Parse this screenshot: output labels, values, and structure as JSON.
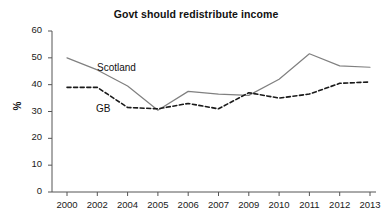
{
  "chart_data": {
    "type": "line",
    "title": "Govt should redistribute income",
    "xlabel": "",
    "ylabel": "%",
    "categories": [
      "2000",
      "2002",
      "2004",
      "2005",
      "2006",
      "2007",
      "2009",
      "2010",
      "2011",
      "2012",
      "2013"
    ],
    "ylim": [
      0,
      60
    ],
    "yticks": [
      0,
      10,
      20,
      30,
      40,
      50,
      60
    ],
    "grid": false,
    "legend_position": "inline-annotation",
    "series": [
      {
        "name": "Scotland",
        "style": "solid",
        "color": "#808080",
        "values": [
          50,
          45.5,
          39.5,
          30.5,
          37.5,
          36.5,
          36,
          42,
          51.5,
          47,
          46.5
        ]
      },
      {
        "name": "GB",
        "style": "dashed",
        "color": "#1a1a1a",
        "values": [
          39,
          39,
          31.5,
          31,
          33,
          31,
          37,
          35,
          36.5,
          40.5,
          41
        ]
      }
    ],
    "annotations": [
      {
        "text": "Scotland",
        "x_px": 97,
        "y_px": 62
      },
      {
        "text": "GB",
        "x_px": 96,
        "y_px": 103
      }
    ]
  }
}
